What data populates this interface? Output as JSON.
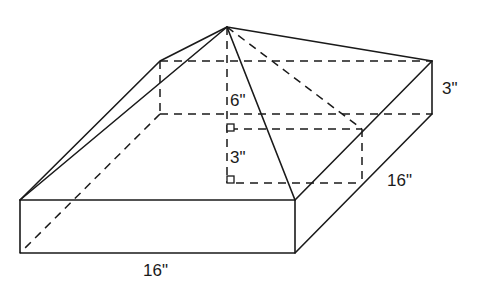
{
  "figure": {
    "labels": {
      "pyramid_height": "6\"",
      "inner_height": "3\"",
      "box_height": "3\"",
      "depth": "16\"",
      "width": "16\""
    },
    "colors": {
      "stroke": "#1a1a1a",
      "background": "#ffffff"
    }
  }
}
